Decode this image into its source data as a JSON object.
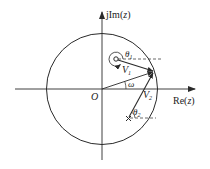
{
  "diagram": {
    "type": "z-plane frequency response geometry",
    "axes": {
      "imag_label_prefix": "jIm(",
      "imag_label_var": "z",
      "imag_label_suffix": ")",
      "real_label_prefix": "Re(",
      "real_label_var": "z",
      "real_label_suffix": ")"
    },
    "origin_label": "O",
    "unit_circle": true,
    "zero_marker": "o",
    "pole_marker": "×",
    "angles": {
      "theta1": "θ",
      "theta1_sub": "1",
      "theta2": "θ",
      "theta2_sub": "2",
      "omega": "ω"
    },
    "vectors": {
      "v1": "V",
      "v1_sub": "1",
      "v2": "V",
      "v2_sub": "2"
    },
    "colors": {
      "stroke": "#2a2a2a",
      "background": "#ffffff"
    }
  }
}
